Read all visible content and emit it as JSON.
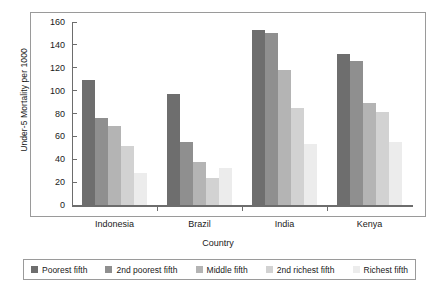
{
  "chart_data": {
    "type": "bar",
    "title": "",
    "xlabel": "Country",
    "ylabel": "Under-5 Mortality per 1000",
    "categories": [
      "Indonesia",
      "Brazil",
      "India",
      "Kenya"
    ],
    "ylim": [
      0,
      160
    ],
    "yticks": [
      0,
      20,
      40,
      60,
      80,
      100,
      120,
      140,
      160
    ],
    "grid": false,
    "legend_position": "bottom",
    "series": [
      {
        "name": "Poorest fifth",
        "color": "#6e6e6e",
        "values": [
          109,
          97,
          153,
          132
        ]
      },
      {
        "name": "2nd poorest fifth",
        "color": "#8f8f8f",
        "values": [
          76,
          55,
          150,
          126
        ]
      },
      {
        "name": "Middle fifth",
        "color": "#b4b4b4",
        "values": [
          69,
          38,
          118,
          89
        ]
      },
      {
        "name": "2nd richest fifth",
        "color": "#d2d2d2",
        "values": [
          52,
          24,
          85,
          81
        ]
      },
      {
        "name": "Richest fifth",
        "color": "#ececec",
        "values": [
          28,
          32,
          53,
          55
        ]
      }
    ]
  },
  "legend": {
    "items": [
      {
        "label": "Poorest fifth"
      },
      {
        "label": "2nd poorest fifth"
      },
      {
        "label": "Middle fifth"
      },
      {
        "label": "2nd richest fifth"
      },
      {
        "label": "Richest fifth"
      }
    ]
  }
}
